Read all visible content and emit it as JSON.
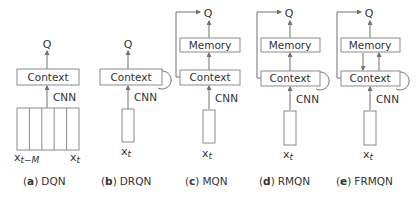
{
  "labels": {
    "q": "Q",
    "context": "Context",
    "memory": "Memory",
    "cnn": "CNN",
    "x_t": "x",
    "t_sub": "t",
    "x_tm_sub": "t−M"
  },
  "panels": [
    {
      "letter": "a",
      "name": "DQN",
      "paren_open": "(",
      "paren_close": ")"
    },
    {
      "letter": "b",
      "name": "DRQN",
      "paren_open": "(",
      "paren_close": ")"
    },
    {
      "letter": "c",
      "name": "MQN",
      "paren_open": "(",
      "paren_close": ")"
    },
    {
      "letter": "d",
      "name": "RMQN",
      "paren_open": "(",
      "paren_close": ")"
    },
    {
      "letter": "e",
      "name": "FRMQN",
      "paren_open": "(",
      "paren_close": ")"
    }
  ],
  "colors": {
    "stroke": "#8a8a8a",
    "text": "#333333"
  }
}
